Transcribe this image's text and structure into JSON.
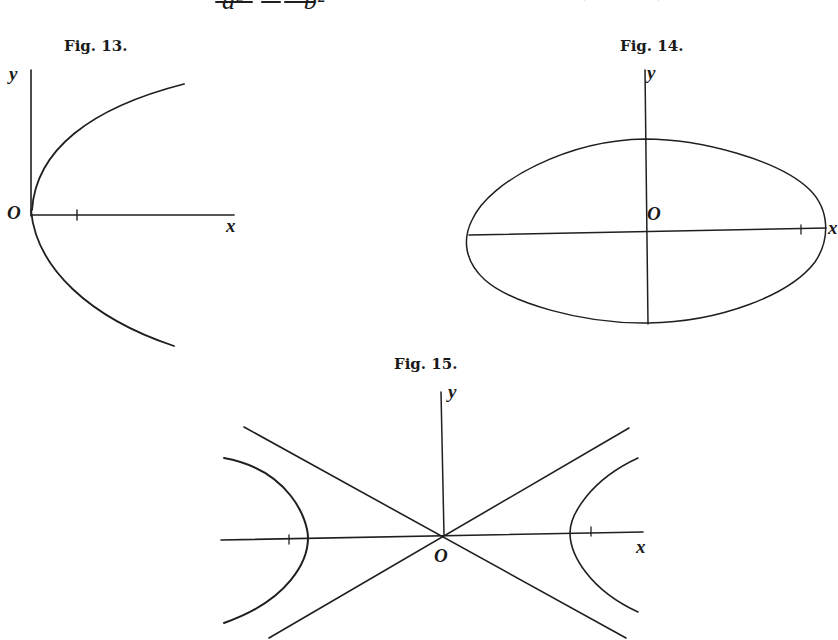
{
  "text": {
    "top_line_partial": "a²        b²  = 1,  for  the  hyperbola  (fig.  15);",
    "top_line_den_a": "a²",
    "top_line_den_b": "b²",
    "top_line_rest": "= 1,  for  the  hyperbola  (fig.  15);"
  },
  "figures": [
    {
      "id": "fig13",
      "caption": "Fig. 13.",
      "curve": "parabola",
      "labels": {
        "y": "y",
        "x": "x",
        "origin": "O"
      }
    },
    {
      "id": "fig14",
      "caption": "Fig. 14.",
      "curve": "ellipse",
      "labels": {
        "y": "y",
        "x": "x",
        "origin": "O"
      }
    },
    {
      "id": "fig15",
      "caption": "Fig. 15.",
      "curve": "hyperbola with asymptotes",
      "labels": {
        "y": "y",
        "x": "x",
        "origin": "O"
      }
    }
  ]
}
